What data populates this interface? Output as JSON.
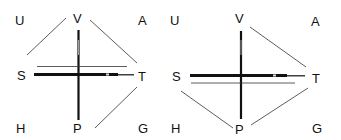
{
  "diagrams": [
    {
      "id": "left",
      "labels": {
        "top_left": "U",
        "top_center": "V",
        "top_right": "A",
        "mid_left": "S",
        "mid_right": "T",
        "bottom_left": "H",
        "bottom_center": "P",
        "bottom_right": "G"
      },
      "thin_parallel_line": "above"
    },
    {
      "id": "right",
      "labels": {
        "top_left": "U",
        "top_center": "V",
        "top_right": "A",
        "mid_left": "S",
        "mid_right": "T",
        "bottom_left": "H",
        "bottom_center": "P",
        "bottom_right": "G"
      },
      "thin_parallel_line": "below"
    }
  ],
  "colors": {
    "ink": "#111111",
    "thin_line": "#333333",
    "background": "#ffffff"
  }
}
